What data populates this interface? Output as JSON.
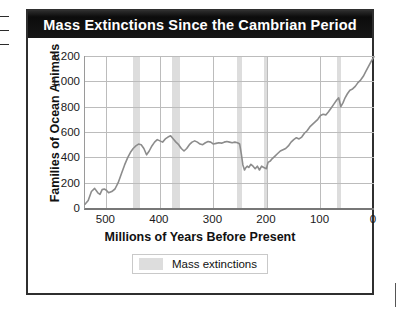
{
  "figure": {
    "title": "Mass Extinctions Since the Cambrian Period",
    "legend": {
      "swatch_name": "mass-extinction-swatch",
      "label": "Mass extinctions",
      "swatch_color": "#dddddd"
    },
    "colors": {
      "title_bar": "#111111",
      "title_text": "#ffffff",
      "curve": "#8c8c8c",
      "grid": "#bcbcbc",
      "band": "#dddddd",
      "frame": "#2f2f2f"
    }
  },
  "chart_data": {
    "type": "line",
    "title": "Mass Extinctions Since the Cambrian Period",
    "xlabel": "Millions of Years Before Present",
    "ylabel": "Families of Ocean Animals",
    "xlim": [
      540,
      0
    ],
    "ylim": [
      0,
      1200
    ],
    "x_ticks": [
      "500",
      "400",
      "300",
      "200",
      "100",
      "0"
    ],
    "x_tick_values": [
      500,
      400,
      300,
      200,
      100,
      0
    ],
    "y_ticks": [
      "0",
      "200",
      "400",
      "600",
      "800",
      "1,000",
      "1,200"
    ],
    "y_tick_values": [
      0,
      200,
      400,
      600,
      800,
      1000,
      1200
    ],
    "x_axis_reversed": true,
    "grid": true,
    "legend_position": "below-axis-center",
    "series": [
      {
        "name": "Families of Ocean Animals",
        "color": "#8c8c8c",
        "x": [
          540,
          534,
          528,
          522,
          516,
          512,
          508,
          504,
          500,
          496,
          490,
          484,
          478,
          472,
          466,
          460,
          455,
          450,
          445,
          440,
          435,
          430,
          425,
          420,
          415,
          410,
          405,
          400,
          395,
          390,
          385,
          380,
          375,
          370,
          365,
          360,
          355,
          350,
          345,
          340,
          335,
          330,
          325,
          320,
          315,
          310,
          305,
          300,
          295,
          290,
          285,
          280,
          275,
          270,
          265,
          260,
          255,
          251,
          248,
          245,
          242,
          240,
          237,
          234,
          230,
          226,
          222,
          218,
          214,
          210,
          206,
          201,
          198,
          194,
          190,
          185,
          180,
          175,
          170,
          165,
          160,
          155,
          150,
          145,
          140,
          135,
          130,
          125,
          120,
          115,
          110,
          105,
          100,
          95,
          90,
          85,
          80,
          75,
          70,
          66,
          62,
          58,
          54,
          50,
          45,
          40,
          35,
          30,
          25,
          20,
          15,
          10,
          5,
          0
        ],
        "y": [
          30,
          60,
          130,
          155,
          120,
          108,
          145,
          150,
          140,
          120,
          130,
          150,
          200,
          270,
          340,
          400,
          440,
          470,
          490,
          505,
          500,
          470,
          420,
          450,
          490,
          520,
          540,
          530,
          520,
          545,
          560,
          570,
          545,
          520,
          500,
          470,
          450,
          470,
          500,
          520,
          530,
          520,
          505,
          500,
          515,
          525,
          520,
          505,
          510,
          515,
          512,
          520,
          525,
          520,
          515,
          520,
          515,
          505,
          430,
          340,
          300,
          315,
          330,
          320,
          345,
          330,
          310,
          330,
          300,
          330,
          320,
          310,
          360,
          370,
          390,
          410,
          430,
          450,
          460,
          470,
          490,
          520,
          540,
          555,
          545,
          560,
          590,
          610,
          640,
          660,
          680,
          700,
          730,
          740,
          735,
          760,
          790,
          820,
          850,
          870,
          800,
          830,
          870,
          900,
          930,
          940,
          960,
          990,
          1010,
          1040,
          1080,
          1120,
          1160,
          1195
        ]
      }
    ],
    "mass_extinction_bands": [
      {
        "name": "end-ordovician",
        "x_start": 450,
        "x_end": 437
      },
      {
        "name": "late-devonian",
        "x_start": 378,
        "x_end": 362
      },
      {
        "name": "end-permian",
        "x_start": 256,
        "x_end": 246
      },
      {
        "name": "end-triassic",
        "x_start": 206,
        "x_end": 198
      },
      {
        "name": "end-cretaceous",
        "x_start": 70,
        "x_end": 62
      }
    ]
  }
}
